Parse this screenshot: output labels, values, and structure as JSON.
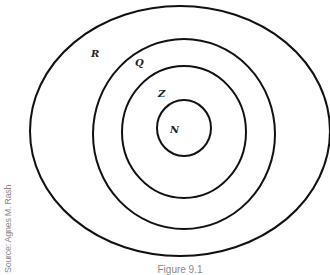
{
  "diagram": {
    "rings": [
      {
        "label": "R"
      },
      {
        "label": "Q"
      },
      {
        "label": "Z"
      },
      {
        "label": "N"
      }
    ]
  },
  "source": "Source: Agnes M. Rash",
  "caption": "Figure 9.1"
}
